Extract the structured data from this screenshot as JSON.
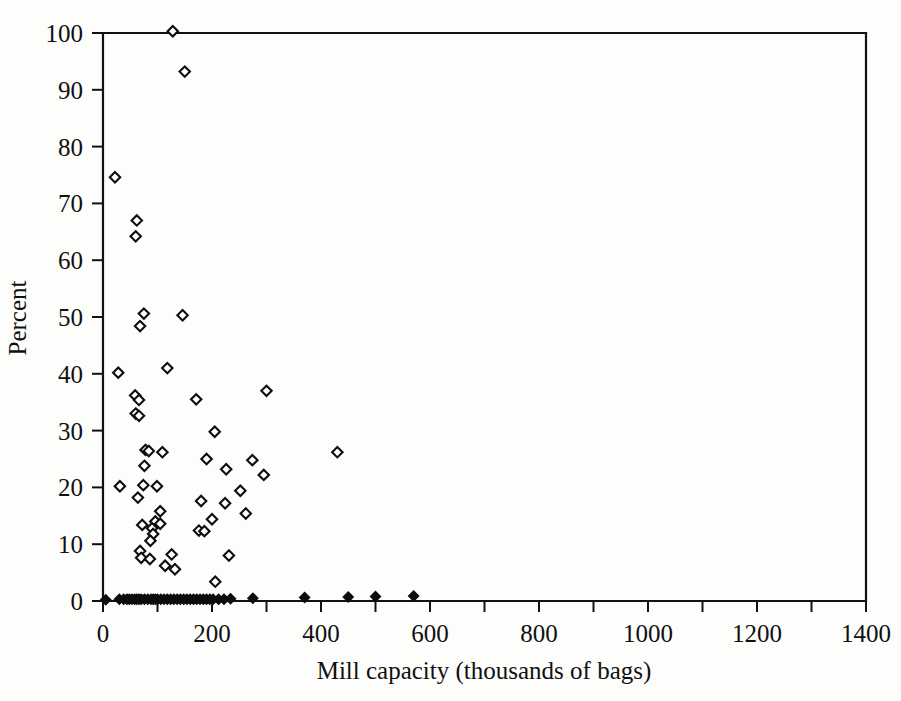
{
  "chart_data": {
    "type": "scatter",
    "title": "",
    "xlabel": "Mill capacity (thousands of bags)",
    "ylabel": "Percent",
    "xlim": [
      0,
      1400
    ],
    "ylim": [
      0,
      100
    ],
    "xticks": [
      0,
      200,
      400,
      600,
      800,
      1000,
      1200,
      1400
    ],
    "xtick_labels": [
      "0",
      "200",
      "400",
      "600",
      "800",
      "1000",
      "1200",
      "1400"
    ],
    "xminorticks": [
      100,
      300,
      500,
      700,
      900,
      1100,
      1300
    ],
    "yticks": [
      0,
      10,
      20,
      30,
      40,
      50,
      60,
      70,
      80,
      90,
      100
    ],
    "ytick_labels": [
      "0",
      "10",
      "20",
      "30",
      "40",
      "50",
      "60",
      "70",
      "80",
      "90",
      "100"
    ],
    "grid": false,
    "legend": null,
    "marker": "open-diamond",
    "marker_baseline": "filled-diamond",
    "series": [
      {
        "name": "Mills",
        "points": [
          [
            128,
            100.3
          ],
          [
            150,
            93.2
          ],
          [
            22,
            74.6
          ],
          [
            62,
            67.0
          ],
          [
            60,
            64.2
          ],
          [
            75,
            50.6
          ],
          [
            146,
            50.3
          ],
          [
            68,
            48.4
          ],
          [
            118,
            41.0
          ],
          [
            28,
            40.2
          ],
          [
            59,
            36.2
          ],
          [
            66,
            35.4
          ],
          [
            171,
            35.5
          ],
          [
            60,
            33.0
          ],
          [
            66,
            32.6
          ],
          [
            300,
            37.0
          ],
          [
            205,
            29.8
          ],
          [
            78,
            26.6
          ],
          [
            84,
            26.4
          ],
          [
            109,
            26.2
          ],
          [
            430,
            26.2
          ],
          [
            190,
            25.0
          ],
          [
            274,
            24.8
          ],
          [
            76,
            23.8
          ],
          [
            226,
            23.2
          ],
          [
            295,
            22.2
          ],
          [
            31,
            20.2
          ],
          [
            74,
            20.4
          ],
          [
            99,
            20.2
          ],
          [
            252,
            19.4
          ],
          [
            64,
            18.2
          ],
          [
            180,
            17.6
          ],
          [
            224,
            17.2
          ],
          [
            105,
            15.8
          ],
          [
            262,
            15.4
          ],
          [
            200,
            14.4
          ],
          [
            96,
            14.0
          ],
          [
            105,
            13.6
          ],
          [
            72,
            13.4
          ],
          [
            90,
            12.8
          ],
          [
            176,
            12.4
          ],
          [
            186,
            12.3
          ],
          [
            92,
            11.8
          ],
          [
            87,
            10.6
          ],
          [
            68,
            8.8
          ],
          [
            70,
            7.6
          ],
          [
            86,
            7.4
          ],
          [
            126,
            8.2
          ],
          [
            231,
            8.0
          ],
          [
            114,
            6.2
          ],
          [
            132,
            5.6
          ],
          [
            206,
            3.4
          ]
        ],
        "baseline_points": [
          [
            5,
            0.2
          ],
          [
            30,
            0.3
          ],
          [
            38,
            0.3
          ],
          [
            44,
            0.3
          ],
          [
            48,
            0.3
          ],
          [
            53,
            0.3
          ],
          [
            58,
            0.3
          ],
          [
            62,
            0.3
          ],
          [
            66,
            0.3
          ],
          [
            70,
            0.3
          ],
          [
            76,
            0.3
          ],
          [
            82,
            0.3
          ],
          [
            88,
            0.3
          ],
          [
            92,
            0.3
          ],
          [
            96,
            0.3
          ],
          [
            100,
            0.3
          ],
          [
            106,
            0.3
          ],
          [
            112,
            0.3
          ],
          [
            118,
            0.3
          ],
          [
            124,
            0.3
          ],
          [
            130,
            0.3
          ],
          [
            136,
            0.3
          ],
          [
            142,
            0.3
          ],
          [
            148,
            0.3
          ],
          [
            154,
            0.3
          ],
          [
            160,
            0.3
          ],
          [
            166,
            0.3
          ],
          [
            172,
            0.3
          ],
          [
            178,
            0.3
          ],
          [
            184,
            0.3
          ],
          [
            190,
            0.3
          ],
          [
            196,
            0.3
          ],
          [
            202,
            0.3
          ],
          [
            212,
            0.3
          ],
          [
            222,
            0.3
          ],
          [
            234,
            0.4
          ],
          [
            275,
            0.5
          ],
          [
            370,
            0.6
          ],
          [
            450,
            0.7
          ],
          [
            500,
            0.8
          ],
          [
            570,
            0.9
          ]
        ]
      }
    ]
  }
}
